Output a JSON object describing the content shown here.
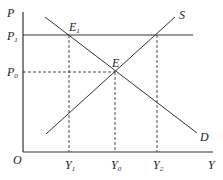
{
  "diagram": {
    "type": "supply-demand",
    "axes": {
      "y_label": "P",
      "x_label": "Y",
      "origin": "O"
    },
    "price_levels": [
      {
        "name": "P1",
        "main": "P",
        "sub": "1"
      },
      {
        "name": "P0",
        "main": "P",
        "sub": "0"
      }
    ],
    "quantities": [
      {
        "name": "Y1",
        "main": "Y",
        "sub": "1"
      },
      {
        "name": "Y0",
        "main": "Y",
        "sub": "0"
      },
      {
        "name": "Y2",
        "main": "Y",
        "sub": "2"
      }
    ],
    "curves": {
      "supply": "S",
      "demand": "D"
    },
    "points": {
      "equilibrium": {
        "main": "E",
        "sub": ""
      },
      "e1": {
        "main": "E",
        "sub": "1"
      }
    },
    "colors": {
      "line": "#333333",
      "text": "#222222"
    }
  }
}
